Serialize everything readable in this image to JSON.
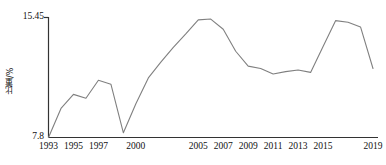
{
  "chart_data": {
    "type": "line",
    "title": "",
    "xlabel": "",
    "ylabel": "比重/%",
    "ylim": [
      7.8,
      15.45
    ],
    "xlim": [
      1993,
      2019
    ],
    "grid": false,
    "legend": null,
    "yticks": [
      "7.8",
      "15.45"
    ],
    "ytick_values": [
      7.8,
      15.45
    ],
    "xtick_labels": [
      "1993",
      "1995",
      "1997",
      "2000",
      "2005",
      "2007",
      "2009",
      "2011",
      "2013",
      "2015",
      "2019"
    ],
    "xtick_values": [
      1993,
      1995,
      1997,
      2000,
      2005,
      2007,
      2009,
      2011,
      2013,
      2015,
      2019
    ],
    "line_color": "#808080",
    "x": [
      1993,
      1994,
      1995,
      1996,
      1997,
      1998,
      1999,
      2000,
      2001,
      2002,
      2003,
      2004,
      2005,
      2006,
      2007,
      2008,
      2009,
      2010,
      2011,
      2012,
      2013,
      2014,
      2015,
      2016,
      2017,
      2018,
      2019
    ],
    "values": [
      7.8,
      9.65,
      10.55,
      10.3,
      11.45,
      11.2,
      8.1,
      9.95,
      11.6,
      12.6,
      13.55,
      14.4,
      15.3,
      15.35,
      14.7,
      13.3,
      12.35,
      12.2,
      11.85,
      12.0,
      12.1,
      11.95,
      13.6,
      15.25,
      15.15,
      14.85,
      12.2
    ]
  }
}
